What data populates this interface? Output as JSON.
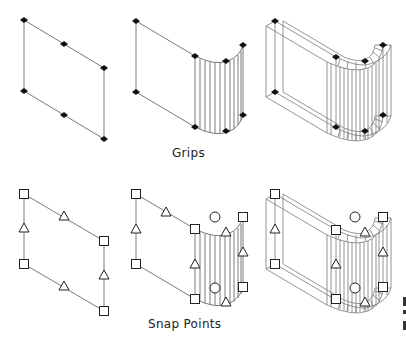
{
  "labels": {
    "grips": "Grips",
    "snap_points": "Snap Points"
  },
  "colors": {
    "background": "#ffffff",
    "line": "#7a7a7a",
    "grip_fill": "#111111",
    "marker_stroke": "#222222"
  },
  "legend": {
    "grip_marker": "filled-diamond",
    "endpoint_marker": "square",
    "midpoint_marker": "triangle",
    "center_marker": "circle"
  },
  "rows": [
    {
      "name": "grips",
      "figures": [
        "flat-panel",
        "panel-with-curved-section",
        "thick-panel-with-curved-section"
      ]
    },
    {
      "name": "snap-points",
      "figures": [
        "flat-panel",
        "panel-with-curved-section",
        "thick-panel-with-curved-section"
      ]
    }
  ]
}
